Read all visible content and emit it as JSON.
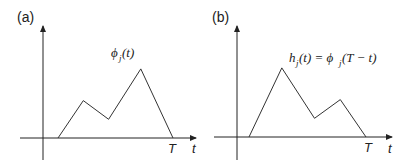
{
  "panels": [
    {
      "label": "(a)",
      "function_label": "ϕj(t)",
      "function_name": "phi_j(t)",
      "t_axis_label": "t",
      "end_tick_label": "T",
      "waveform_points": [
        [
          0.0,
          0.0
        ],
        [
          0.22,
          0.52
        ],
        [
          0.44,
          0.26
        ],
        [
          0.72,
          0.96
        ],
        [
          1.0,
          0.0
        ]
      ]
    },
    {
      "label": "(b)",
      "function_label": "hj(t) = ϕj(T − t)",
      "function_name": "h_j(t) = phi_j(T - t)",
      "t_axis_label": "t",
      "end_tick_label": "T",
      "waveform_points": [
        [
          0.0,
          0.0
        ],
        [
          0.28,
          0.96
        ],
        [
          0.56,
          0.26
        ],
        [
          0.78,
          0.52
        ],
        [
          1.0,
          0.0
        ]
      ]
    }
  ]
}
